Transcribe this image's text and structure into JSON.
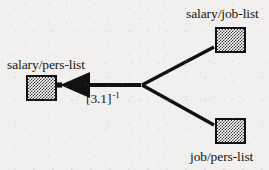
{
  "diagram": {
    "type": "directed-graph",
    "background_color": "#f1f0ee",
    "stroke_color": "#111111",
    "node_fill_color": "#8a8a8a",
    "nodes": [
      {
        "id": "salary-pers-list",
        "label": "salary/pers-list",
        "label_position": "above",
        "box": {
          "x": 26,
          "y": 75,
          "w": 31,
          "h": 26
        },
        "label_xy": {
          "x": 7,
          "y": 58
        }
      },
      {
        "id": "salary-job-list",
        "label": "salary/job-list",
        "label_position": "above",
        "box": {
          "x": 215,
          "y": 27,
          "w": 31,
          "h": 26
        },
        "label_xy": {
          "x": 186,
          "y": 7
        }
      },
      {
        "id": "job-pers-list",
        "label": "job/pers-list",
        "label_position": "below",
        "box": {
          "x": 215,
          "y": 118,
          "w": 31,
          "h": 26
        },
        "label_xy": {
          "x": 190,
          "y": 150
        }
      }
    ],
    "vertex": {
      "x": 141,
      "y": 85
    },
    "edges": [
      {
        "id": "join-edge-arrow",
        "from": "vertex",
        "to": "salary-pers-list",
        "arrowhead": "solid-triangle-left",
        "label": "[3.1]",
        "label_exponent": "-1",
        "label_xy": {
          "x": 86,
          "y": 92
        }
      },
      {
        "id": "input-edge-upper",
        "from": "salary-job-list",
        "to": "vertex",
        "arrowhead": "none"
      },
      {
        "id": "input-edge-lower",
        "from": "job-pers-list",
        "to": "vertex",
        "arrowhead": "none"
      }
    ]
  }
}
